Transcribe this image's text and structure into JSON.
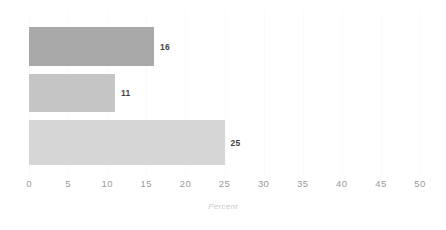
{
  "chart_data": {
    "type": "bar",
    "orientation": "horizontal",
    "title": "",
    "subtitle": "",
    "xlabel": "Percent",
    "ylabel": "",
    "xlim": [
      0,
      50
    ],
    "ylim": [
      0,
      3
    ],
    "grid": true,
    "grid_axis": "x",
    "legend": false,
    "legend_position": "none",
    "categories": [
      "",
      "",
      ""
    ],
    "values": [
      16,
      11,
      25
    ],
    "value_labels": [
      "16",
      "11",
      "25"
    ],
    "bar_colors": [
      "#a9a9a9",
      "#c5c5c5",
      "#d6d6d6"
    ],
    "xticks": [
      0,
      5,
      10,
      15,
      20,
      25,
      30,
      35,
      40,
      45,
      50
    ],
    "xtick_labels": [
      "0",
      "5",
      "10",
      "15",
      "20",
      "25",
      "30",
      "35",
      "40",
      "45",
      "50"
    ],
    "bars": [
      {
        "name": "bar-1",
        "value": 16,
        "label": "16",
        "color": "#a9a9a9",
        "top": 15,
        "height": 39
      },
      {
        "name": "bar-2",
        "value": 11,
        "label": "11",
        "color": "#c5c5c5",
        "top": 62,
        "height": 38
      },
      {
        "name": "bar-3",
        "value": 25,
        "label": "25",
        "color": "#d6d6d6",
        "top": 108,
        "height": 45
      }
    ]
  },
  "style": {
    "background": "#ffffff",
    "gridline_color": "#fafafa",
    "tick_label_color": "#9a9a9a",
    "axis_title_color": "#c9c9c9",
    "value_label_color": "#444444"
  }
}
